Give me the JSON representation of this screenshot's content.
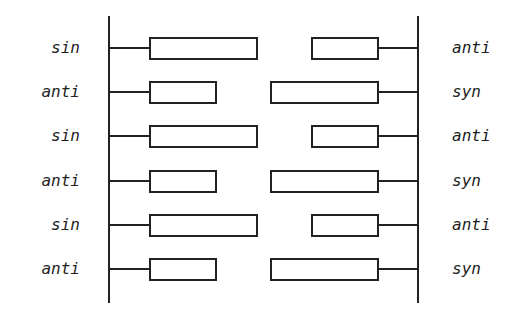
{
  "diagram": {
    "type": "bilayer-strand-alignment",
    "left_strand": {
      "labels": [
        "sin",
        "anti",
        "sin",
        "anti",
        "sin",
        "anti"
      ],
      "box_lengths": [
        "long",
        "short",
        "long",
        "short",
        "long",
        "short"
      ]
    },
    "right_strand": {
      "labels": [
        "anti",
        "syn",
        "anti",
        "syn",
        "anti",
        "syn"
      ],
      "box_lengths": [
        "short",
        "long",
        "short",
        "long",
        "short",
        "long"
      ]
    },
    "line_color": "#222222",
    "background": "#ffffff"
  }
}
